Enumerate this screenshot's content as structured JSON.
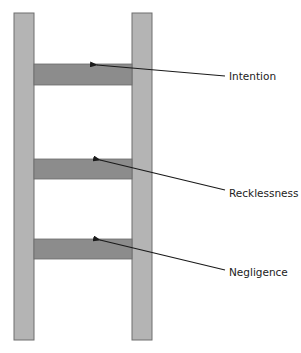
{
  "diagram": {
    "type": "ladder",
    "colors": {
      "rail_fill": "#b4b4b4",
      "rail_stroke": "#6e6e6e",
      "rung_fill": "#8c8c8c",
      "rung_stroke": "#6a6a6a",
      "arrow": "#1a1a1a",
      "text": "#222222"
    },
    "rungs": [
      {
        "label": "Intention"
      },
      {
        "label": "Recklessness"
      },
      {
        "label": "Negligence"
      }
    ]
  }
}
